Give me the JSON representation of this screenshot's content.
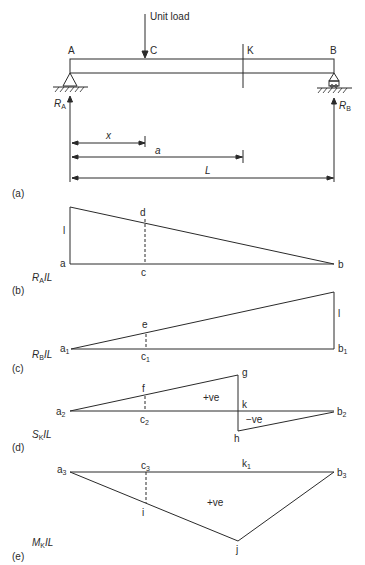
{
  "figure": {
    "panel_a": {
      "tag": "(a)",
      "load_label": "Unit load",
      "points": {
        "A": "A",
        "C": "C",
        "K": "K",
        "B": "B"
      },
      "reactions": {
        "RA": "R",
        "RA_sub": "A",
        "RB": "R",
        "RB_sub": "B"
      },
      "dimensions": {
        "x": "x",
        "a": "a",
        "L": "L"
      }
    },
    "panel_b": {
      "tag": "(b)",
      "name": "R",
      "name_sub": "A",
      "name_suffix": "IL",
      "points": {
        "a": "a",
        "b": "b",
        "c": "c",
        "d": "d"
      },
      "ordinate": "l"
    },
    "panel_c": {
      "tag": "(c)",
      "name": "R",
      "name_sub": "B",
      "name_suffix": "IL",
      "points": {
        "a": "a",
        "a_sub": "1",
        "b": "b",
        "b_sub": "1",
        "c": "c",
        "c_sub": "1",
        "e": "e"
      },
      "ordinate": "l"
    },
    "panel_d": {
      "tag": "(d)",
      "name": "S",
      "name_sub": "K",
      "name_suffix": "IL",
      "points": {
        "a": "a",
        "a_sub": "2",
        "b": "b",
        "b_sub": "2",
        "c": "c",
        "c_sub": "2",
        "f": "f",
        "g": "g",
        "h": "h",
        "k": "k"
      },
      "positive": "+ve",
      "negative": "−ve"
    },
    "panel_e": {
      "tag": "(e)",
      "name": "M",
      "name_sub": "K",
      "name_suffix": "IL",
      "points": {
        "a": "a",
        "a_sub": "3",
        "b": "b",
        "b_sub": "3",
        "c": "c",
        "c_sub": "3",
        "k": "k",
        "k_sub": "1",
        "i": "i",
        "j": "j"
      },
      "positive": "+ve"
    }
  }
}
